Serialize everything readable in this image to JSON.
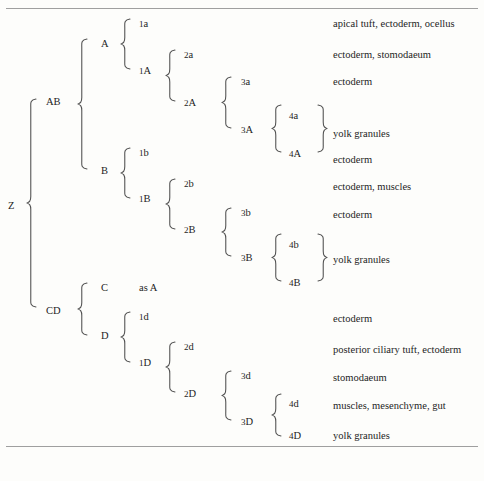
{
  "figure": {
    "clipped_header": "",
    "rules": [
      {
        "name": "top-rule",
        "y": 8
      },
      {
        "name": "bottom-rule",
        "y": 446
      }
    ]
  },
  "nodes": {
    "root": {
      "label": "Z",
      "x": 8,
      "y": 200
    },
    "ab": {
      "label": "AB",
      "x": 46,
      "y": 96
    },
    "cd": {
      "label": "CD",
      "x": 46,
      "y": 305
    },
    "a": {
      "label": "A",
      "x": 101,
      "y": 38
    },
    "b": {
      "label": "B",
      "x": 101,
      "y": 165
    },
    "c": {
      "label": "C",
      "x": 101,
      "y": 282
    },
    "d": {
      "label": "D",
      "x": 101,
      "y": 330
    },
    "n1a": {
      "label": "1a",
      "x": 139,
      "y": 18
    },
    "n1A": {
      "label": "1A",
      "x": 139,
      "y": 65
    },
    "n1b": {
      "label": "1b",
      "x": 139,
      "y": 147
    },
    "n1B": {
      "label": "1B",
      "x": 139,
      "y": 193
    },
    "as_a": {
      "label": "as A",
      "x": 139,
      "y": 282
    },
    "n1d": {
      "label": "1d",
      "x": 139,
      "y": 311
    },
    "n1D": {
      "label": "1D",
      "x": 139,
      "y": 357
    },
    "n2a": {
      "label": "2a",
      "x": 184,
      "y": 49
    },
    "n2A": {
      "label": "2A",
      "x": 184,
      "y": 97
    },
    "n2b": {
      "label": "2b",
      "x": 184,
      "y": 178
    },
    "n2B": {
      "label": "2B",
      "x": 184,
      "y": 224
    },
    "n2d": {
      "label": "2d",
      "x": 184,
      "y": 341
    },
    "n2D": {
      "label": "2D",
      "x": 184,
      "y": 388
    },
    "n3a": {
      "label": "3a",
      "x": 241,
      "y": 76
    },
    "n3A": {
      "label": "3A",
      "x": 241,
      "y": 124
    },
    "n3b": {
      "label": "3b",
      "x": 241,
      "y": 207
    },
    "n3B": {
      "label": "3B",
      "x": 241,
      "y": 252
    },
    "n3d": {
      "label": "3d",
      "x": 241,
      "y": 370
    },
    "n3D": {
      "label": "3D",
      "x": 241,
      "y": 416
    },
    "n4a": {
      "label": "4a",
      "x": 289,
      "y": 110
    },
    "n4A": {
      "label": "4A",
      "x": 289,
      "y": 148
    },
    "n4b": {
      "label": "4b",
      "x": 289,
      "y": 239
    },
    "n4B": {
      "label": "4B",
      "x": 289,
      "y": 277
    },
    "n4d": {
      "label": "4d",
      "x": 289,
      "y": 398
    },
    "n4D": {
      "label": "4D",
      "x": 289,
      "y": 430
    }
  },
  "fates": [
    {
      "name": "fate-1a",
      "text": "apical tuft, ectoderm, ocellus",
      "x": 333,
      "y": 18
    },
    {
      "name": "fate-2a",
      "text": "ectoderm, stomodaeum",
      "x": 333,
      "y": 49
    },
    {
      "name": "fate-3a",
      "text": "ectoderm",
      "x": 333,
      "y": 76
    },
    {
      "name": "fate-4aA",
      "text": "yolk granules",
      "x": 333,
      "y": 128
    },
    {
      "name": "fate-1b",
      "text": "ectoderm",
      "x": 333,
      "y": 154
    },
    {
      "name": "fate-2b",
      "text": "ectoderm, muscles",
      "x": 333,
      "y": 181
    },
    {
      "name": "fate-3b",
      "text": "ectoderm",
      "x": 333,
      "y": 209
    },
    {
      "name": "fate-4bB",
      "text": "yolk granules",
      "x": 333,
      "y": 254
    },
    {
      "name": "fate-1d",
      "text": "ectoderm",
      "x": 333,
      "y": 313
    },
    {
      "name": "fate-2d",
      "text": "posterior ciliary tuft, ectoderm",
      "x": 333,
      "y": 344
    },
    {
      "name": "fate-3d",
      "text": "stomodaeum",
      "x": 333,
      "y": 372
    },
    {
      "name": "fate-4d",
      "text": "muscles, mesenchyme, gut",
      "x": 333,
      "y": 400
    },
    {
      "name": "fate-4D",
      "text": "yolk granules",
      "x": 333,
      "y": 430
    }
  ],
  "braces": [
    {
      "name": "brace-Z",
      "x": 27,
      "y": 99,
      "h": 208,
      "dir": "left"
    },
    {
      "name": "brace-AB",
      "x": 78,
      "y": 39,
      "h": 130,
      "dir": "left"
    },
    {
      "name": "brace-CD",
      "x": 78,
      "y": 283,
      "h": 52,
      "dir": "left"
    },
    {
      "name": "brace-A",
      "x": 121,
      "y": 19,
      "h": 50,
      "dir": "left"
    },
    {
      "name": "brace-B",
      "x": 121,
      "y": 148,
      "h": 50,
      "dir": "left"
    },
    {
      "name": "brace-D",
      "x": 121,
      "y": 312,
      "h": 50,
      "dir": "left"
    },
    {
      "name": "brace-1A",
      "x": 166,
      "y": 50,
      "h": 51,
      "dir": "left"
    },
    {
      "name": "brace-1B",
      "x": 166,
      "y": 179,
      "h": 50,
      "dir": "left"
    },
    {
      "name": "brace-1D",
      "x": 166,
      "y": 342,
      "h": 50,
      "dir": "left"
    },
    {
      "name": "brace-2A",
      "x": 222,
      "y": 77,
      "h": 51,
      "dir": "left"
    },
    {
      "name": "brace-2B",
      "x": 222,
      "y": 208,
      "h": 48,
      "dir": "left"
    },
    {
      "name": "brace-2D",
      "x": 222,
      "y": 371,
      "h": 49,
      "dir": "left"
    },
    {
      "name": "brace-3A-l",
      "x": 272,
      "y": 105,
      "h": 47,
      "dir": "left"
    },
    {
      "name": "brace-3A-r",
      "x": 317,
      "y": 105,
      "h": 47,
      "dir": "right"
    },
    {
      "name": "brace-3B-l",
      "x": 272,
      "y": 234,
      "h": 47,
      "dir": "left"
    },
    {
      "name": "brace-3B-r",
      "x": 317,
      "y": 234,
      "h": 47,
      "dir": "right"
    },
    {
      "name": "brace-3D-l",
      "x": 272,
      "y": 394,
      "h": 42,
      "dir": "left"
    }
  ]
}
